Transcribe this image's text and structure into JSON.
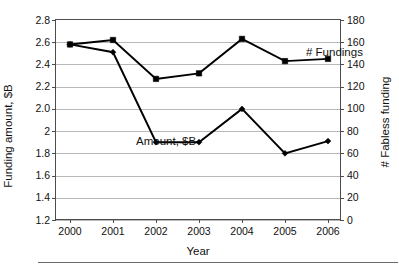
{
  "chart_data": {
    "type": "line",
    "title": "",
    "xlabel": "Year",
    "ylabel": "Funding amount, $B",
    "y2label": "# Fabless funding",
    "categories": [
      "2000",
      "2001",
      "2002",
      "2003",
      "2004",
      "2005",
      "2006"
    ],
    "x": [
      2000,
      2001,
      2002,
      2003,
      2004,
      2005,
      2006
    ],
    "ylim": [
      1.2,
      2.8
    ],
    "y2lim": [
      0,
      180
    ],
    "yticks": [
      "2.8",
      "2.6",
      "2.4",
      "2.2",
      "2.0",
      "2",
      "1.8",
      "1.6",
      "1.4",
      "1.2"
    ],
    "ytick_values": [
      2.8,
      2.6,
      2.4,
      2.2,
      2.0,
      2.0,
      1.8,
      1.6,
      1.4,
      1.2
    ],
    "y2ticks": [
      "180",
      "160",
      "140",
      "120",
      "100",
      "80",
      "60",
      "40",
      "20",
      "0"
    ],
    "y2tick_values": [
      180,
      160,
      140,
      120,
      100,
      80,
      60,
      40,
      20,
      0
    ],
    "grid": true,
    "legend_position": "in-plot-annotations",
    "series": [
      {
        "name": "# Fundings",
        "axis": "right",
        "marker": "square",
        "color": "#000000",
        "values": [
          158,
          162,
          127,
          132,
          163,
          143,
          145
        ]
      },
      {
        "name": "Amount, $B",
        "axis": "left",
        "marker": "diamond",
        "color": "#000000",
        "values": [
          2.58,
          2.51,
          1.9,
          1.9,
          2.0,
          1.8,
          1.91
        ]
      }
    ],
    "annotations": [
      {
        "text": "# Fundings",
        "series": "# Fundings"
      },
      {
        "text": "Amount, $B",
        "series": "Amount, $B"
      }
    ]
  },
  "axes": {
    "left": {
      "title": "Funding amount, $B",
      "ticks": [
        "2.8",
        "2.6",
        "2.4",
        "2.2",
        "2.0",
        "2",
        "1.8",
        "1.6",
        "1.4",
        "1.2"
      ]
    },
    "right": {
      "title": "# Fabless funding",
      "ticks": [
        "180",
        "160",
        "140",
        "120",
        "100",
        "80",
        "60",
        "40",
        "20",
        "0"
      ]
    },
    "bottom": {
      "title": "Year",
      "ticks": [
        "2000",
        "2001",
        "2002",
        "2003",
        "2004",
        "2005",
        "2006"
      ]
    }
  },
  "labels": {
    "fundings": "# Fundings",
    "amount": "Amount, $B"
  }
}
